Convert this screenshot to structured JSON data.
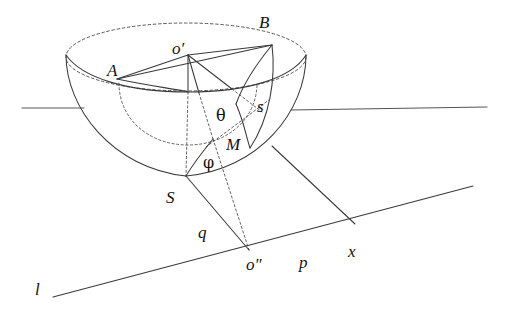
{
  "figure": {
    "stroke_color": "#3a3a3a",
    "dash_color": "#4f4f4f",
    "background": "#ffffff",
    "width": 508,
    "height": 332
  },
  "labels": {
    "o_prime": "o′",
    "o_double_prime": "o″",
    "point_a": "A",
    "point_b": "B",
    "point_s_upper": "S",
    "point_m": "M",
    "arc_s": "s",
    "segment_q": "q",
    "segment_p": "p",
    "axis_x": "x",
    "line_l": "l",
    "angle_theta": "θ",
    "angle_phi": "φ"
  },
  "label_positions": {
    "o_prime": {
      "x": 172,
      "y": 40
    },
    "point_a": {
      "x": 107,
      "y": 62
    },
    "point_b": {
      "x": 259,
      "y": 14
    },
    "angle_theta": {
      "x": 216,
      "y": 108
    },
    "arc_s": {
      "x": 257,
      "y": 98
    },
    "point_m": {
      "x": 226,
      "y": 136
    },
    "angle_phi": {
      "x": 203,
      "y": 155
    },
    "point_s_upper": {
      "x": 166,
      "y": 189
    },
    "segment_q": {
      "x": 198,
      "y": 224
    },
    "o_double_prime": {
      "x": 246,
      "y": 256
    },
    "segment_p": {
      "x": 299,
      "y": 254
    },
    "axis_x": {
      "x": 348,
      "y": 243
    },
    "line_l": {
      "x": 35,
      "y": 281
    }
  },
  "geometry": {
    "o_prime_point": {
      "x": 188,
      "y": 55
    },
    "point_a_point": {
      "x": 117,
      "y": 79
    },
    "point_b_point": {
      "x": 272,
      "y": 45
    },
    "point_m_point": {
      "x": 213,
      "y": 139
    },
    "point_s_point": {
      "x": 186,
      "y": 176
    },
    "o_double_prime_point": {
      "x": 249,
      "y": 250
    },
    "rim_center": {
      "x": 186,
      "y": 57
    },
    "rim_radius_x": 120,
    "rim_radius_y": 34,
    "bowl_bottom": {
      "x": 186,
      "y": 176
    }
  },
  "notes": {
    "description": "Bowl (hemisphere) with dashed elliptical rim, radii o'A and o'B, spherical sector wedge, angles theta and phi, and ground line l with segments q, p and axis x."
  }
}
